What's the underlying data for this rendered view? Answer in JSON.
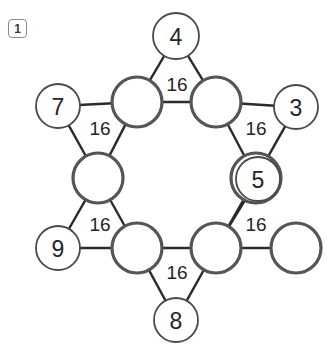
{
  "figure": {
    "panel_badge": "1",
    "background_color": "#ffffff",
    "hub_stroke_color": "#555555",
    "leaf_stroke_color": "#4a4a4a",
    "edge_stroke_color": "#2b2b2b",
    "label_color": "#252525",
    "width": 327,
    "height": 349
  },
  "graph": {
    "hub_nodes": [
      {
        "id": "hub-top-left",
        "label": "",
        "cx": 137,
        "cy": 102,
        "r": 25
      },
      {
        "id": "hub-top-right",
        "label": "",
        "cx": 216,
        "cy": 102,
        "r": 25
      },
      {
        "id": "hub-left",
        "label": "",
        "cx": 98,
        "cy": 178,
        "r": 25
      },
      {
        "id": "hub-right",
        "label": "",
        "cx": 256,
        "cy": 178,
        "r": 25
      },
      {
        "id": "hub-bottom-left",
        "label": "",
        "cx": 137,
        "cy": 248,
        "r": 25
      },
      {
        "id": "hub-bottom-right",
        "label": "",
        "cx": 216,
        "cy": 248,
        "r": 25
      }
    ],
    "leaf_nodes": [
      {
        "id": "leaf-top",
        "label": "4",
        "cx": 176,
        "cy": 36,
        "r": 23
      },
      {
        "id": "leaf-upper-left",
        "label": "7",
        "cx": 58,
        "cy": 106,
        "r": 22
      },
      {
        "id": "leaf-upper-right",
        "label": "3",
        "cx": 296,
        "cy": 107,
        "r": 22
      },
      {
        "id": "leaf-mid-right",
        "label": "5",
        "cx": 258,
        "cy": 179,
        "r": 22
      },
      {
        "id": "leaf-lower-left",
        "label": "9",
        "cx": 58,
        "cy": 248,
        "r": 22
      },
      {
        "id": "leaf-lower-right",
        "label": "",
        "cx": 296,
        "cy": 248,
        "r": 25
      },
      {
        "id": "leaf-bottom",
        "label": "8",
        "cx": 176,
        "cy": 320,
        "r": 22
      }
    ],
    "edges": [
      {
        "id": "edge-hubtl-hubtr",
        "from": "hub-top-left",
        "to": "hub-top-right"
      },
      {
        "id": "edge-hubtl-hubl",
        "from": "hub-top-left",
        "to": "hub-left"
      },
      {
        "id": "edge-hubtr-hubr",
        "from": "hub-top-right",
        "to": "hub-right"
      },
      {
        "id": "edge-hubl-hubbl",
        "from": "hub-left",
        "to": "hub-bottom-left"
      },
      {
        "id": "edge-hubr-hubbr",
        "from": "hub-right",
        "to": "hub-bottom-right"
      },
      {
        "id": "edge-hubbl-hubbr",
        "from": "hub-bottom-left",
        "to": "hub-bottom-right"
      },
      {
        "id": "edge-leaftop-hubtl",
        "from": "leaf-top",
        "to": "hub-top-left"
      },
      {
        "id": "edge-leaftop-hubtr",
        "from": "leaf-top",
        "to": "hub-top-right"
      },
      {
        "id": "edge-leaf7-hubtl",
        "from": "leaf-upper-left",
        "to": "hub-top-left"
      },
      {
        "id": "edge-leaf7-hubl",
        "from": "leaf-upper-left",
        "to": "hub-left"
      },
      {
        "id": "edge-leaf3-hubtr",
        "from": "leaf-upper-right",
        "to": "hub-top-right"
      },
      {
        "id": "edge-leaf3-hubr",
        "from": "leaf-upper-right",
        "to": "hub-right"
      },
      {
        "id": "edge-leaf5-hubr",
        "from": "leaf-mid-right",
        "to": "hub-right"
      },
      {
        "id": "edge-leaf9-hubl",
        "from": "leaf-lower-left",
        "to": "hub-left"
      },
      {
        "id": "edge-leaf9-hubbl",
        "from": "leaf-lower-left",
        "to": "hub-bottom-left"
      },
      {
        "id": "edge-leafbr-hubbr",
        "from": "leaf-lower-right",
        "to": "hub-bottom-right"
      },
      {
        "id": "edge-leaf5-hubbr",
        "from": "leaf-mid-right",
        "to": "hub-bottom-right"
      },
      {
        "id": "edge-leaf8-hubbl",
        "from": "leaf-bottom",
        "to": "hub-bottom-left"
      },
      {
        "id": "edge-leaf8-hubbr",
        "from": "leaf-bottom",
        "to": "hub-bottom-right"
      }
    ],
    "edge_labels": [
      {
        "id": "edge-label-top",
        "value": "16",
        "x": 177,
        "y": 84
      },
      {
        "id": "edge-label-upper-left",
        "value": "16",
        "x": 100,
        "y": 128
      },
      {
        "id": "edge-label-upper-right",
        "value": "16",
        "x": 256,
        "y": 128
      },
      {
        "id": "edge-label-lower-left",
        "value": "16",
        "x": 100,
        "y": 224
      },
      {
        "id": "edge-label-lower-right",
        "value": "16",
        "x": 256,
        "y": 224
      },
      {
        "id": "edge-label-bottom",
        "value": "16",
        "x": 177,
        "y": 272
      }
    ]
  }
}
